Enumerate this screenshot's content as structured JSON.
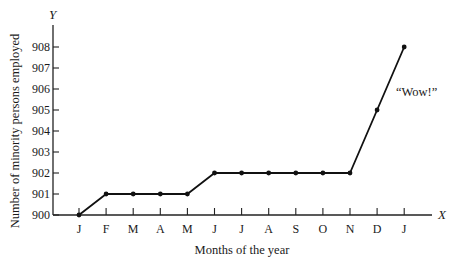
{
  "chart_data": {
    "type": "line",
    "title": "",
    "xlabel": "Months of the year",
    "ylabel": "Number of minority persons employed",
    "x_axis_name": "X",
    "y_axis_name": "Y",
    "categories": [
      "J",
      "F",
      "M",
      "A",
      "M",
      "J",
      "J",
      "A",
      "S",
      "O",
      "N",
      "D",
      "J"
    ],
    "series": [
      {
        "name": "Minority persons employed",
        "values": [
          900,
          901,
          901,
          901,
          901,
          902,
          902,
          902,
          902,
          902,
          902,
          905,
          908
        ]
      }
    ],
    "y_ticks": [
      900,
      901,
      902,
      903,
      904,
      905,
      906,
      907,
      908
    ],
    "ylim": [
      900,
      909
    ],
    "grid": false,
    "legend": "none",
    "annotations": [
      {
        "text": "“Wow!”",
        "near_point_index": 11
      }
    ]
  }
}
